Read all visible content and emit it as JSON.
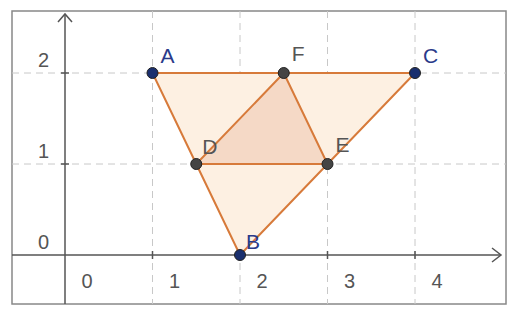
{
  "diagram": {
    "frame": {
      "x": 12,
      "y": 11,
      "w": 494,
      "h": 293
    },
    "origin_px": {
      "x": 65,
      "y": 255
    },
    "unit_px": {
      "x": 87.5,
      "y": 91
    },
    "axes": {
      "x_ticks": [
        "0",
        "1",
        "2",
        "3",
        "4"
      ],
      "y_ticks": [
        "0",
        "1",
        "2"
      ]
    },
    "points": [
      {
        "label": "A",
        "x": 1,
        "y": 2,
        "color": "#1a2f6e",
        "label_color": "#2a3a8a"
      },
      {
        "label": "B",
        "x": 2,
        "y": 0,
        "color": "#1a2f6e",
        "label_color": "#2a3a8a"
      },
      {
        "label": "C",
        "x": 4,
        "y": 2,
        "color": "#1a2f6e",
        "label_color": "#2a3a8a"
      },
      {
        "label": "D",
        "x": 1.5,
        "y": 1,
        "color": "#444444",
        "label_color": "#555555"
      },
      {
        "label": "E",
        "x": 3,
        "y": 1,
        "color": "#444444",
        "label_color": "#555555"
      },
      {
        "label": "F",
        "x": 2.5,
        "y": 2,
        "color": "#444444",
        "label_color": "#555555"
      }
    ],
    "polygons": [
      {
        "name": "triangle-ABC",
        "vertices": [
          "A",
          "B",
          "C"
        ],
        "fill": "#fdf0e2"
      },
      {
        "name": "triangle-DEF",
        "vertices": [
          "D",
          "E",
          "F"
        ],
        "fill": "#f5d9c6"
      }
    ],
    "colors": {
      "edge": "#d77a3a",
      "grid": "#c8c8c8",
      "axis": "#555555",
      "frame": "#888888",
      "tick_text": "#555555"
    }
  }
}
